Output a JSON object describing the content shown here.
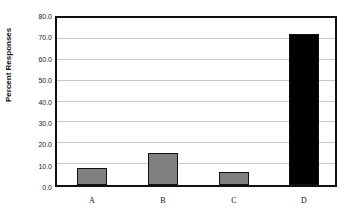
{
  "chart_data": {
    "type": "bar",
    "title": "",
    "xlabel": "",
    "ylabel": "Percent Responses",
    "categories": [
      "A",
      "B",
      "C",
      "D"
    ],
    "values": [
      8.0,
      15.3,
      6.3,
      72.3
    ],
    "colors": [
      "#808080",
      "#808080",
      "#808080",
      "#000000"
    ],
    "ylim": [
      0,
      80
    ],
    "yticks": [
      "0.0",
      "10.0",
      "20.0",
      "30.0",
      "40.0",
      "50.0",
      "60.0",
      "70.0",
      "80.0"
    ],
    "grid": true,
    "legend": null
  }
}
